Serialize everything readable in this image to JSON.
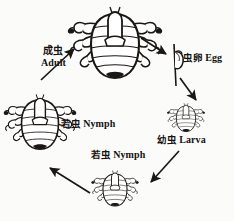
{
  "diagram": {
    "background_color": "#fbfbfa",
    "ink_color": "#1a1714",
    "stages": [
      {
        "id": "adult",
        "label_cn": "成虫",
        "label_en": "Adult",
        "figure": "adult-louse"
      },
      {
        "id": "egg",
        "label_cn": "虫卵",
        "label_en": "Egg",
        "figure": "louse-egg-on-hair"
      },
      {
        "id": "larva",
        "label_cn": "幼虫",
        "label_en": "Larva",
        "figure": "larva-louse"
      },
      {
        "id": "nymph-bottom",
        "label_cn": "若虫",
        "label_en": "Nymph",
        "figure": "nymph-louse-small"
      },
      {
        "id": "nymph-left",
        "label_cn": "若虫",
        "label_en": "Nymph",
        "figure": "nymph-louse-large"
      }
    ],
    "arrows": [
      {
        "id": "adult-to-egg",
        "from": "adult",
        "to": "egg",
        "direction": "down-right"
      },
      {
        "id": "egg-to-larva",
        "from": "egg",
        "to": "larva",
        "direction": "down-right"
      },
      {
        "id": "larva-to-nymph-bottom",
        "from": "larva",
        "to": "nymph-bottom",
        "direction": "down-left"
      },
      {
        "id": "nymph-bottom-to-nymph-left",
        "from": "nymph-bottom",
        "to": "nymph-left",
        "direction": "up-left"
      },
      {
        "id": "nymph-left-to-adult",
        "from": "nymph-left",
        "to": "adult",
        "direction": "up-right"
      }
    ]
  }
}
